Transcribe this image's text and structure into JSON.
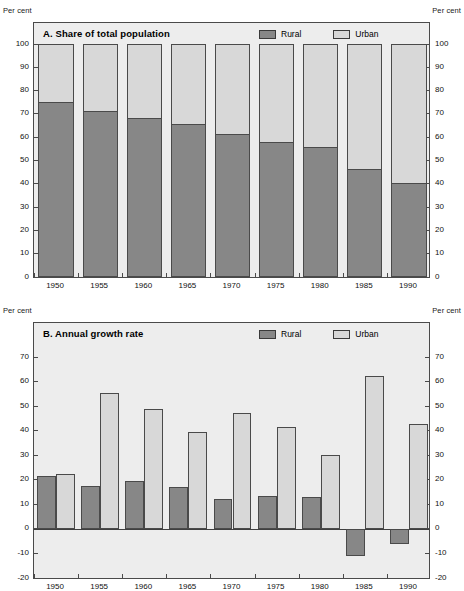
{
  "units": {
    "top_left": "Per cent",
    "top_right": "Per cent",
    "mid_left": "Per cent",
    "mid_right": "Per cent"
  },
  "legend": {
    "rural": "Rural",
    "urban": "Urban",
    "rural_color": "#878787",
    "urban_color": "#d8d8d8"
  },
  "chart_data": [
    {
      "type": "bar",
      "id": "A",
      "title": "A.  Share of total population",
      "stacked": true,
      "xlabel": "",
      "ylabel": "Per cent",
      "ylim": [
        0,
        100
      ],
      "yticks": [
        0,
        10,
        20,
        30,
        40,
        50,
        60,
        70,
        80,
        90,
        100
      ],
      "grid": false,
      "legend_position": "top-right",
      "categories": [
        "1950",
        "1955",
        "1960",
        "1965",
        "1970",
        "1975",
        "1980",
        "1985",
        "1990"
      ],
      "series": [
        {
          "name": "Rural",
          "color": "#878787",
          "values": [
            75.0,
            71.2,
            68.1,
            65.5,
            61.3,
            57.9,
            55.7,
            46.4,
            40.5
          ]
        },
        {
          "name": "Urban",
          "color": "#d8d8d8",
          "values": [
            25.0,
            28.8,
            31.9,
            34.5,
            38.7,
            42.1,
            44.3,
            53.6,
            59.5
          ]
        }
      ]
    },
    {
      "type": "bar",
      "id": "B",
      "title": "B.  Annual growth rate",
      "stacked": false,
      "xlabel": "",
      "ylabel": "Per cent",
      "ylim": [
        -20,
        77
      ],
      "yticks": [
        -20,
        -10,
        0,
        10,
        20,
        30,
        40,
        50,
        60,
        70
      ],
      "grid": false,
      "legend_position": "top-right",
      "categories": [
        "1950",
        "1955",
        "1960",
        "1965",
        "1970",
        "1975",
        "1980",
        "1985",
        "1990"
      ],
      "series": [
        {
          "name": "Rural",
          "color": "#878787",
          "values": [
            21.6,
            17.5,
            19.5,
            17.1,
            12.3,
            13.5,
            13.1,
            -11.2,
            -6.2
          ]
        },
        {
          "name": "Urban",
          "color": "#d8d8d8",
          "values": [
            22.4,
            55.6,
            49.0,
            39.7,
            47.1,
            41.4,
            30.1,
            62.2,
            42.6
          ]
        }
      ]
    }
  ]
}
